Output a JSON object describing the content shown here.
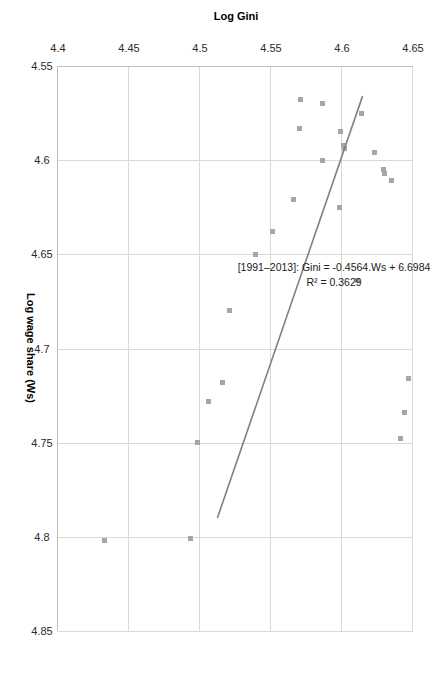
{
  "chart_data": {
    "type": "scatter",
    "title": "",
    "xlabel": "Log wage share (Ws)",
    "ylabel": "Log Gini",
    "xlim": [
      4.55,
      4.85
    ],
    "ylim": [
      4.4,
      4.65
    ],
    "xticks": [
      "4.55",
      "4.6",
      "4.65",
      "4.7",
      "4.75",
      "4.8",
      "4.85"
    ],
    "yticks": [
      "4.4",
      "4.45",
      "4.5",
      "4.55",
      "4.6",
      "4.65"
    ],
    "xtick_values": [
      4.55,
      4.6,
      4.65,
      4.7,
      4.75,
      4.8,
      4.85
    ],
    "ytick_values": [
      4.4,
      4.45,
      4.5,
      4.55,
      4.6,
      4.65
    ],
    "grid": true,
    "legend": "none",
    "orientation": "rotated-90-clockwise",
    "marker": {
      "shape": "square",
      "size_px": 5,
      "color": "#a6a6a6"
    },
    "series": [
      {
        "name": "Gini vs Log wage share",
        "points": [
          {
            "x": 4.568,
            "y": 4.571
          },
          {
            "x": 4.57,
            "y": 4.586
          },
          {
            "x": 4.575,
            "y": 4.614
          },
          {
            "x": 4.583,
            "y": 4.57
          },
          {
            "x": 4.585,
            "y": 4.599
          },
          {
            "x": 4.592,
            "y": 4.601
          },
          {
            "x": 4.594,
            "y": 4.602
          },
          {
            "x": 4.596,
            "y": 4.623
          },
          {
            "x": 4.6,
            "y": 4.586
          },
          {
            "x": 4.605,
            "y": 4.629
          },
          {
            "x": 4.607,
            "y": 4.63
          },
          {
            "x": 4.611,
            "y": 4.635
          },
          {
            "x": 4.621,
            "y": 4.566
          },
          {
            "x": 4.625,
            "y": 4.598
          },
          {
            "x": 4.638,
            "y": 4.551
          },
          {
            "x": 4.65,
            "y": 4.539
          },
          {
            "x": 4.664,
            "y": 4.611
          },
          {
            "x": 4.68,
            "y": 4.521
          },
          {
            "x": 4.716,
            "y": 4.647
          },
          {
            "x": 4.718,
            "y": 4.516
          },
          {
            "x": 4.728,
            "y": 4.506
          },
          {
            "x": 4.734,
            "y": 4.644
          },
          {
            "x": 4.748,
            "y": 4.641
          },
          {
            "x": 4.75,
            "y": 4.498
          },
          {
            "x": 4.801,
            "y": 4.493
          },
          {
            "x": 4.802,
            "y": 4.433
          }
        ]
      }
    ],
    "trendline": {
      "equation_label": "[1991–2013]: Gini = -0.4564.Ws + 6.6984",
      "r2_label": "R² = 0.3629",
      "slope": -0.4564,
      "intercept": 6.6984,
      "r_squared": 0.3629,
      "color": "#808080",
      "x_start": 4.566,
      "x_end": 4.79
    },
    "annotation": {
      "line1": "[1991–2013]: Gini = -0.4564.Ws + 6.6984",
      "line2": "R² = 0.3629"
    }
  },
  "axes": {
    "x_title": "Log wage share (Ws)",
    "y_title": "Log Gini"
  }
}
